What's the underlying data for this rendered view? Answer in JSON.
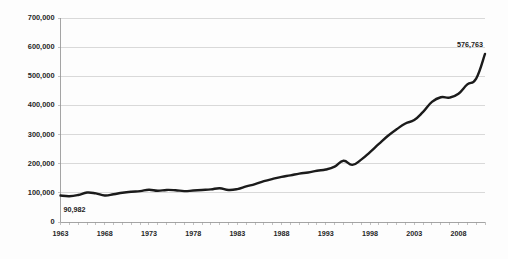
{
  "chart_data": {
    "type": "line",
    "title": "",
    "xlabel": "",
    "ylabel": "",
    "grid": true,
    "legend": false,
    "xlim": [
      1963,
      2011
    ],
    "ylim": [
      0,
      700000
    ],
    "ytick_labels": [
      "700,000",
      "600,000",
      "500,000",
      "400,000",
      "300,000",
      "200,000",
      "100,000",
      "0"
    ],
    "ytick_values": [
      700000,
      600000,
      500000,
      400000,
      300000,
      200000,
      100000,
      0
    ],
    "xtick_labels": [
      "1963",
      "1968",
      "1973",
      "1978",
      "1983",
      "1988",
      "1993",
      "1998",
      "2003",
      "2008"
    ],
    "xtick_values": [
      1963,
      1968,
      1973,
      1978,
      1983,
      1988,
      1993,
      1998,
      2003,
      2008
    ],
    "line_color": "#1b1b1b",
    "grid_color": "#c9c9c9",
    "background_color": "#fdfdfd",
    "x": [
      1963,
      1964,
      1965,
      1966,
      1967,
      1968,
      1969,
      1970,
      1971,
      1972,
      1973,
      1974,
      1975,
      1976,
      1977,
      1978,
      1979,
      1980,
      1981,
      1982,
      1983,
      1984,
      1985,
      1986,
      1987,
      1988,
      1989,
      1990,
      1991,
      1992,
      1993,
      1994,
      1995,
      1996,
      1997,
      1998,
      1999,
      2000,
      2001,
      2002,
      2003,
      2004,
      2005,
      2006,
      2007,
      2008,
      2009,
      2010,
      2011
    ],
    "values": [
      90982,
      88500,
      92500,
      101000,
      98000,
      91000,
      95000,
      100500,
      104000,
      106000,
      110500,
      107000,
      110000,
      109000,
      106000,
      108000,
      110000,
      112000,
      116000,
      110000,
      113000,
      122000,
      130000,
      140000,
      148000,
      155000,
      160000,
      166000,
      170000,
      176000,
      180000,
      190000,
      210000,
      196000,
      214000,
      240000,
      268000,
      295000,
      318000,
      338000,
      350000,
      378000,
      412000,
      428000,
      427000,
      440000,
      472000,
      492000,
      576763
    ],
    "annotations": [
      {
        "name": "start-value-label",
        "label": "90,982",
        "x": 1963,
        "y": 90982
      },
      {
        "name": "end-value-label",
        "label": "576,763",
        "x": 2011,
        "y": 576763
      }
    ]
  }
}
